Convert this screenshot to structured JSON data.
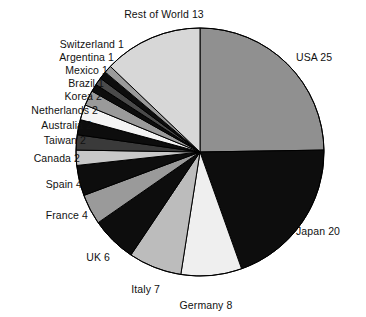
{
  "chart_data": {
    "type": "pie",
    "title": "",
    "xlabel": "",
    "ylabel": "",
    "total": 100,
    "start_angle_deg": 0,
    "direction": "clockwise",
    "legend": "none",
    "grid": false,
    "categories": [
      "USA",
      "Japan",
      "Germany",
      "Italy",
      "UK",
      "France",
      "Spain",
      "Canada",
      "Taiwan",
      "Australia",
      "Netherlands",
      "Korea",
      "Brazil",
      "Mexico",
      "Argentina",
      "Switzerland",
      "Rest of World"
    ],
    "values": [
      25,
      20,
      8,
      7,
      6,
      4,
      4,
      2,
      2,
      2,
      2,
      2,
      1,
      1,
      1,
      1,
      13
    ],
    "slices": [
      {
        "label": "USA 25",
        "name": "USA",
        "value": 25,
        "color": "#909090"
      },
      {
        "label": "Japan 20",
        "name": "Japan",
        "value": 20,
        "color": "#0d0d0d"
      },
      {
        "label": "Germany 8",
        "name": "Germany",
        "value": 8,
        "color": "#efefef"
      },
      {
        "label": "Italy 7",
        "name": "Italy",
        "value": 7,
        "color": "#bcbcbc"
      },
      {
        "label": "UK 6",
        "name": "UK",
        "value": 6,
        "color": "#0d0d0d"
      },
      {
        "label": "France 4",
        "name": "France",
        "value": 4,
        "color": "#9a9a9a"
      },
      {
        "label": "Spain 4",
        "name": "Spain",
        "value": 4,
        "color": "#0d0d0d"
      },
      {
        "label": "Canada 2",
        "name": "Canada",
        "value": 2,
        "color": "#c8c8c8"
      },
      {
        "label": "Taiwan 2",
        "name": "Taiwan",
        "value": 2,
        "color": "#3a3a3a"
      },
      {
        "label": "Australia 2",
        "name": "Australia",
        "value": 2,
        "color": "#0d0d0d"
      },
      {
        "label": "Netherlands 2",
        "name": "Netherlands",
        "value": 2,
        "color": "#f4f4f4"
      },
      {
        "label": "Korea 2",
        "name": "Korea",
        "value": 2,
        "color": "#9a9a9a"
      },
      {
        "label": "Brazil 1",
        "name": "Brazil",
        "value": 1,
        "color": "#0d0d0d"
      },
      {
        "label": "Mexico 1",
        "name": "Mexico",
        "value": 1,
        "color": "#4a4a4a"
      },
      {
        "label": "Argentina 1",
        "name": "Argentina",
        "value": 1,
        "color": "#0d0d0d"
      },
      {
        "label": "Switzerland 1",
        "name": "Switzerland",
        "value": 1,
        "color": "#9a9a9a"
      },
      {
        "label": "Rest of World 13",
        "name": "Rest of World",
        "value": 13,
        "color": "#d7d7d7"
      }
    ],
    "labels": {
      "rest_of_world": "Rest of World 13",
      "switzerland": "Switzerland 1",
      "argentina": "Argentina 1",
      "mexico": "Mexico 1",
      "brazil": "Brazil 1",
      "korea": "Korea 2",
      "netherlands": "Netherlands 2",
      "australia": "Australia 2",
      "taiwan": "Taiwan 2",
      "canada": "Canada 2",
      "spain": "Spain 4",
      "france": "France 4",
      "uk": "UK 6",
      "italy": "Italy 7",
      "germany": "Germany 8",
      "japan": "Japan 20",
      "usa": "USA 25"
    }
  },
  "geometry": {
    "center_x": 200,
    "center_y": 152,
    "radius": 124,
    "stroke": "#000000",
    "stroke_width": 1
  }
}
